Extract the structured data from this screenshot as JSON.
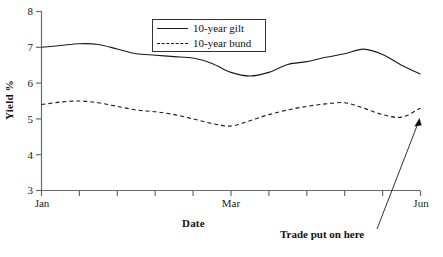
{
  "chart_data": {
    "type": "line",
    "title": "",
    "xlabel": "Date",
    "ylabel": "Yield %",
    "ylim": [
      3,
      8
    ],
    "yticks": [
      3,
      4,
      5,
      6,
      7,
      8
    ],
    "ytick_labels": [
      "3",
      "4",
      "5",
      "6",
      "7",
      "8"
    ],
    "xlim": [
      0,
      10
    ],
    "xticks": [
      0,
      1,
      2,
      3,
      4,
      5,
      6,
      7,
      8,
      9,
      10
    ],
    "xtick_labels": [
      "Jan",
      "",
      "",
      "",
      "",
      "Mar",
      "",
      "",
      "",
      "",
      "Jun"
    ],
    "grid": false,
    "legend_position": "top-center",
    "series": [
      {
        "name": "10-year gilt",
        "style": "solid",
        "color": "#1a1a1a",
        "x": [
          0.0,
          0.5,
          1.0,
          1.5,
          2.0,
          2.5,
          3.0,
          3.5,
          4.0,
          4.5,
          5.0,
          5.5,
          6.0,
          6.5,
          7.0,
          7.5,
          8.0,
          8.5,
          9.0,
          9.5,
          10.0
        ],
        "values": [
          7.0,
          7.05,
          7.1,
          7.08,
          6.95,
          6.82,
          6.78,
          6.74,
          6.7,
          6.55,
          6.3,
          6.2,
          6.3,
          6.52,
          6.6,
          6.72,
          6.82,
          6.95,
          6.8,
          6.5,
          6.25
        ]
      },
      {
        "name": "10-year bund",
        "style": "dashed",
        "color": "#1a1a1a",
        "x": [
          0.0,
          0.5,
          1.0,
          1.5,
          2.0,
          2.5,
          3.0,
          3.5,
          4.0,
          4.5,
          5.0,
          5.5,
          6.0,
          6.5,
          7.0,
          7.5,
          8.0,
          8.5,
          9.0,
          9.5,
          10.0
        ],
        "values": [
          5.4,
          5.47,
          5.5,
          5.45,
          5.35,
          5.25,
          5.2,
          5.12,
          5.0,
          4.87,
          4.8,
          4.95,
          5.12,
          5.25,
          5.35,
          5.42,
          5.45,
          5.3,
          5.12,
          5.05,
          5.3
        ]
      }
    ],
    "annotations": [
      {
        "text": "Trade put on here",
        "x": 10.0,
        "y": 5.3,
        "note": "arrow points to right end of 10-year bund series"
      }
    ]
  },
  "axes": {
    "y_title": "Yield %",
    "x_title": "Date",
    "y_tick_labels": [
      "8",
      "7",
      "6",
      "5",
      "4",
      "3"
    ],
    "x_tick_labels": {
      "start": "Jan",
      "middle": "Mar",
      "end": "Jun"
    }
  },
  "legend": {
    "items": [
      {
        "label": "10-year gilt",
        "style": "solid"
      },
      {
        "label": "10-year bund",
        "style": "dashed"
      }
    ]
  },
  "annotation": {
    "label": "Trade put on here"
  },
  "colors": {
    "line": "#1a1a1a",
    "axis": "#555555",
    "background": "#ffffff"
  }
}
